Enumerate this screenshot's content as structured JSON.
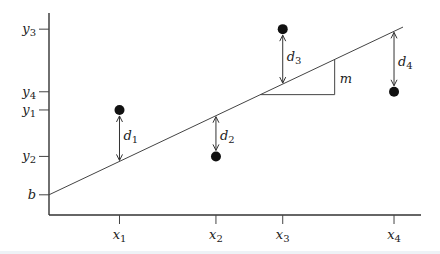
{
  "diagram": {
    "y_ticks": [
      {
        "id": "y3",
        "base": "y",
        "sub": "3",
        "value": 0.92
      },
      {
        "id": "y4",
        "base": "y",
        "sub": "4",
        "value": 0.61
      },
      {
        "id": "y1",
        "base": "y",
        "sub": "1",
        "value": 0.52
      },
      {
        "id": "y2",
        "base": "y",
        "sub": "2",
        "value": 0.29
      },
      {
        "id": "b",
        "base": "b",
        "sub": "",
        "value": 0.1
      }
    ],
    "x_ticks": [
      {
        "id": "x1",
        "base": "x",
        "sub": "1",
        "value": 0.19
      },
      {
        "id": "x2",
        "base": "x",
        "sub": "2",
        "value": 0.45
      },
      {
        "id": "x3",
        "base": "x",
        "sub": "3",
        "value": 0.63
      },
      {
        "id": "x4",
        "base": "x",
        "sub": "4",
        "value": 0.93
      }
    ],
    "line": {
      "intercept": 0.1,
      "slope": 0.87,
      "x_end": 1.0
    },
    "points": [
      {
        "id": "p1",
        "x": 0.19,
        "y": 0.52,
        "residual_label": {
          "base": "d",
          "sub": "1"
        }
      },
      {
        "id": "p2",
        "x": 0.45,
        "y": 0.29,
        "residual_label": {
          "base": "d",
          "sub": "2"
        }
      },
      {
        "id": "p3",
        "x": 0.63,
        "y": 0.92,
        "residual_label": {
          "base": "d",
          "sub": "3"
        }
      },
      {
        "id": "p4",
        "x": 0.93,
        "y": 0.61,
        "residual_label": {
          "base": "d",
          "sub": "4"
        }
      }
    ],
    "slope_triangle": {
      "x_start": 0.57,
      "x_end": 0.77,
      "label": "m"
    }
  }
}
